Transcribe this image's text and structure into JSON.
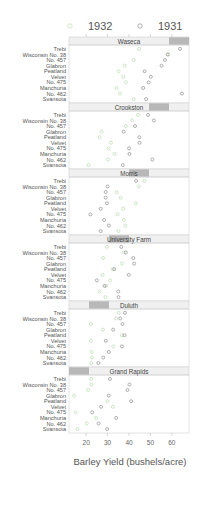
{
  "chart_data": {
    "type": "scatter",
    "title": "",
    "xlabel": "Barley Yield (bushels/acre)",
    "ylabel": "",
    "xlim": [
      12,
      68
    ],
    "xticks": [
      20,
      30,
      40,
      50,
      60
    ],
    "legend": {
      "position": "top",
      "entries": [
        {
          "label": "1932",
          "color": "#c8e6c0"
        },
        {
          "label": "1931",
          "color": "#a8a8a8"
        }
      ]
    },
    "colors": {
      "1932": "#bfe0b6",
      "1931": "#9a9a9a",
      "strip_bg": "#f0f0f0",
      "strip_shade": "#b8b8b8",
      "panel_border": "#cfcfcf",
      "text": "#555555"
    },
    "varieties": [
      "Trebi",
      "Wisconsin No. 38",
      "No. 457",
      "Glabron",
      "Peatland",
      "Velvet",
      "No. 475",
      "Manchuria",
      "No. 462",
      "Svansota"
    ],
    "panels": [
      {
        "site": "Waseca",
        "shade_level": 6,
        "y1932": [
          44.7,
          58.2,
          42.2,
          38.0,
          35.1,
          37.4,
          38.5,
          34.2,
          35.8,
          42.2
        ],
        "y1931": [
          63.8,
          58.1,
          56.8,
          55.2,
          47.3,
          50.2,
          49.2,
          46.6,
          64.7,
          48.0
        ]
      },
      {
        "site": "Crookston",
        "shade_level": 5,
        "y1932": [
          44.2,
          41.5,
          38.5,
          27.2,
          26.3,
          31.6,
          30.5,
          33.3,
          30.3,
          21.1
        ],
        "y1931": [
          48.9,
          51.6,
          42.8,
          37.5,
          44.8,
          44.9,
          40.0,
          40.2,
          50.9,
          37.1
        ]
      },
      {
        "site": "Morris",
        "shade_level": 4,
        "y1932": [
          47.2,
          44.5,
          34.3,
          36.0,
          43.2,
          37.3,
          34.6,
          37.6,
          38.3,
          35.1
        ],
        "y1931": [
          43.3,
          30.0,
          29.1,
          29.1,
          29.7,
          26.8,
          22.0,
          28.4,
          30.6,
          26.8
        ]
      },
      {
        "site": "University Farm",
        "shade_level": 3,
        "y1932": [
          29.7,
          37.5,
          27.9,
          36.7,
          32.4,
          27.7,
          31.2,
          29.3,
          26.2,
          29.0
        ],
        "y1931": [
          36.4,
          38.5,
          42.0,
          42.4,
          33.1,
          39.9,
          25.0,
          28.6,
          35.0,
          35.1
        ]
      },
      {
        "site": "Duluth",
        "shade_level": 2,
        "y1932": [
          35.2,
          34.0,
          22.2,
          27.8,
          36.7,
          22.2,
          32.7,
          22.6,
          22.7,
          22.4
        ],
        "y1931": [
          38.1,
          35.9,
          37.0,
          32.6,
          37.9,
          29.2,
          36.7,
          30.6,
          28.0,
          25.7
        ]
      },
      {
        "site": "Grand Rapids",
        "shade_level": 1,
        "y1932": [
          22.3,
          22.5,
          20.9,
          14.4,
          30.0,
          32.5,
          15.1,
          24.6,
          20.3,
          16.0
        ],
        "y1931": [
          31.1,
          40.2,
          39.3,
          30.5,
          41.0,
          27.0,
          22.8,
          34.0,
          25.8,
          29.8
        ]
      }
    ]
  }
}
